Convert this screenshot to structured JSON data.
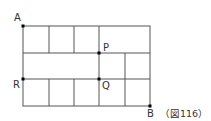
{
  "figure": {
    "caption": "（図116）",
    "colors": {
      "line": "#555555",
      "point": "#000000",
      "text": "#333333"
    }
  },
  "points": {
    "A": {
      "label": "A"
    },
    "P": {
      "label": "P"
    },
    "R": {
      "label": "R"
    },
    "Q": {
      "label": "Q"
    },
    "B": {
      "label": "B"
    }
  },
  "grid": {
    "description": "Rectangular road grid from A (top-left) to B (bottom-right), 3 rows; top row split into 3 small squares + 1 wide cell, middle row 1 wide cell + 2 small cells, bottom row 5 small cells",
    "rows": [
      {
        "cells": [
          1,
          1,
          1,
          2
        ]
      },
      {
        "cells": [
          3,
          1,
          1
        ]
      },
      {
        "cells": [
          1,
          1,
          1,
          1,
          1
        ]
      }
    ]
  }
}
